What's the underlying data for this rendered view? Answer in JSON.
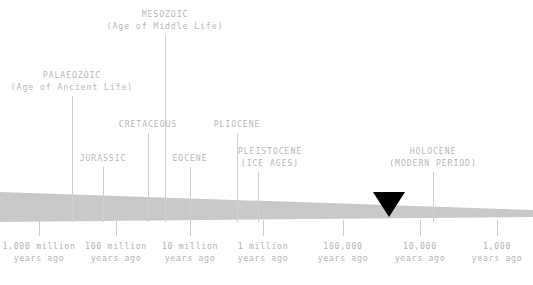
{
  "figure": {
    "title_semantic": "geological-time-scale",
    "band_color": "#c9c9c9",
    "line_color": "#cfcfcf",
    "text_color": "#b9b9b9",
    "marker_color": "#000000",
    "background": "#ffffff"
  },
  "callouts": [
    {
      "name": "palaeozoic",
      "line1": "PALAEOZOIC",
      "line2": "(Age of Ancient Life)",
      "text_x": 72,
      "text_y": 70,
      "leader_x": 72,
      "leader_top": 96,
      "leader_bottom": 222
    },
    {
      "name": "mesozoic",
      "line1": "MESOZOIC",
      "line2": "(Age of Middle Life)",
      "text_x": 165,
      "text_y": 9,
      "leader_x": 165,
      "leader_top": 35,
      "leader_bottom": 222
    },
    {
      "name": "cretaceous",
      "line1": "CRETACEOUS",
      "line2": "",
      "text_x": 148,
      "text_y": 119,
      "leader_x": 148,
      "leader_top": 133,
      "leader_bottom": 222
    },
    {
      "name": "jurassic",
      "line1": "JURASSIC",
      "line2": "",
      "text_x": 103,
      "text_y": 153,
      "leader_x": 103,
      "leader_top": 167,
      "leader_bottom": 222
    },
    {
      "name": "eocene",
      "line1": "EOCENE",
      "line2": "",
      "text_x": 190,
      "text_y": 153,
      "leader_x": 190,
      "leader_top": 167,
      "leader_bottom": 222
    },
    {
      "name": "pliocene",
      "line1": "PLIOCENE",
      "line2": "",
      "text_x": 237,
      "text_y": 119,
      "leader_x": 237,
      "leader_top": 133,
      "leader_bottom": 222
    },
    {
      "name": "pleistocene",
      "line1": "PLEISTOCENE",
      "line2": "(ICE AGES)",
      "text_x": 270,
      "text_y": 146,
      "leader_x": 258,
      "leader_top": 172,
      "leader_bottom": 222
    },
    {
      "name": "holocene",
      "line1": "HOLOCENE",
      "line2": "(MODERN PERIOD)",
      "text_x": 433,
      "text_y": 146,
      "leader_x": 433,
      "leader_top": 172,
      "leader_bottom": 222
    }
  ],
  "axis": {
    "ticks": [
      {
        "name": "1000-million",
        "x": 39,
        "line1": "1,000 million",
        "line2": "years ago"
      },
      {
        "name": "100-million",
        "x": 116,
        "line1": "100 million",
        "line2": "years ago"
      },
      {
        "name": "10-million",
        "x": 190,
        "line1": "10 million",
        "line2": "years ago"
      },
      {
        "name": "1-million",
        "x": 263,
        "line1": "1 million",
        "line2": "years ago"
      },
      {
        "name": "100-thousand",
        "x": 343,
        "line1": "100,000",
        "line2": "years ago"
      },
      {
        "name": "10-thousand",
        "x": 420,
        "line1": "10,000",
        "line2": "years ago"
      },
      {
        "name": "1-thousand",
        "x": 497,
        "line1": "1,000",
        "line2": "years ago"
      }
    ],
    "tick_top": 220,
    "tick_height": 16,
    "label_y": 240
  },
  "marker": {
    "name": "present-marker",
    "x": 389,
    "top": 192,
    "width": 32,
    "height": 25
  },
  "band_geometry": {
    "left_top": 192,
    "left_bottom": 222,
    "right_top": 210,
    "right_bottom": 217
  },
  "chart_data": {
    "type": "timeline",
    "xlabel": "Years ago (logarithmic)",
    "x_axis_type": "log-reversed",
    "tick_labels": [
      "1,000 million years ago",
      "100 million years ago",
      "10 million years ago",
      "1 million years ago",
      "100,000 years ago",
      "10,000 years ago",
      "1,000 years ago"
    ],
    "tick_values": [
      1000000000,
      100000000,
      10000000,
      1000000,
      100000,
      10000,
      1000
    ],
    "annotations": [
      {
        "label": "PALAEOZOIC (Age of Ancient Life)",
        "approx_years_ago": 300000000
      },
      {
        "label": "MESOZOIC (Age of Middle Life)",
        "approx_years_ago": 110000000
      },
      {
        "label": "CRETACEOUS",
        "approx_years_ago": 90000000
      },
      {
        "label": "JURASSIC",
        "approx_years_ago": 170000000
      },
      {
        "label": "EOCENE",
        "approx_years_ago": 10000000
      },
      {
        "label": "PLIOCENE",
        "approx_years_ago": 2500000
      },
      {
        "label": "PLEISTOCENE (ICE AGES)",
        "approx_years_ago": 1500000
      },
      {
        "label": "HOLOCENE (MODERN PERIOD)",
        "approx_years_ago": 7000
      }
    ],
    "marker_note": "present-day triangular marker",
    "grid": false,
    "legend": "none"
  }
}
